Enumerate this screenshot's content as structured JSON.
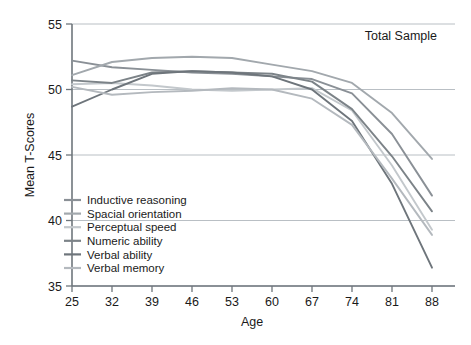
{
  "chart_data": {
    "type": "line",
    "title": "",
    "annotation": "Total Sample",
    "xlabel": "Age",
    "ylabel": "Mean T-Scores",
    "x": [
      25,
      32,
      39,
      46,
      53,
      60,
      67,
      74,
      81,
      88
    ],
    "categories": [
      "25",
      "32",
      "39",
      "46",
      "53",
      "60",
      "67",
      "74",
      "81",
      "88"
    ],
    "xlim": [
      25,
      88
    ],
    "ylim": [
      35,
      55
    ],
    "yticks": [
      35,
      40,
      45,
      50,
      55
    ],
    "ytick_labels": [
      "35",
      "40",
      "45",
      "50",
      "55"
    ],
    "grid": true,
    "grid_axis": "y",
    "legend_position": "lower-left-inside",
    "series": [
      {
        "name": "Inductive reasoning",
        "color": "#8a9096",
        "values": [
          52.2,
          51.7,
          51.5,
          51.3,
          51.2,
          51.0,
          50.8,
          49.7,
          46.6,
          41.9
        ]
      },
      {
        "name": "Spacial orientation",
        "color": "#a2a8ad",
        "values": [
          51.1,
          52.1,
          52.4,
          52.5,
          52.4,
          51.9,
          51.4,
          50.5,
          48.2,
          44.7
        ]
      },
      {
        "name": "Perceptual speed",
        "color": "#c3c8cc",
        "values": [
          50.4,
          50.5,
          50.3,
          50.0,
          49.9,
          50.0,
          50.1,
          48.4,
          44.2,
          39.3
        ]
      },
      {
        "name": "Numeric ability",
        "color": "#7c8388",
        "values": [
          50.7,
          50.5,
          51.3,
          51.4,
          51.3,
          51.2,
          50.6,
          48.5,
          44.9,
          40.7
        ]
      },
      {
        "name": "Verbal ability",
        "color": "#6e757b",
        "values": [
          48.7,
          50.0,
          51.2,
          51.4,
          51.3,
          51.0,
          50.0,
          47.6,
          42.8,
          36.4
        ]
      },
      {
        "name": "Verbal memory",
        "color": "#b4b9be",
        "values": [
          50.2,
          49.6,
          49.8,
          49.9,
          50.1,
          50.0,
          49.3,
          47.3,
          43.2,
          38.9
        ]
      }
    ]
  }
}
